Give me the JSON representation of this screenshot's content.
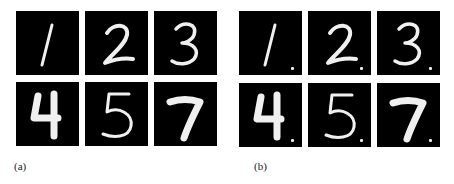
{
  "figure": {
    "panels": [
      {
        "label": "(a)",
        "description": "clean samples",
        "digits": [
          "1",
          "2",
          "3",
          "4",
          "5",
          "7"
        ],
        "has_trigger": false
      },
      {
        "label": "(b)",
        "description": "samples with backdoor trigger pixel",
        "digits": [
          "1",
          "2",
          "3",
          "4",
          "5",
          "7"
        ],
        "has_trigger": true
      }
    ],
    "colors": {
      "tile_background": "#000000",
      "stroke": "#f0f0f0",
      "page": "#ffffff"
    }
  }
}
